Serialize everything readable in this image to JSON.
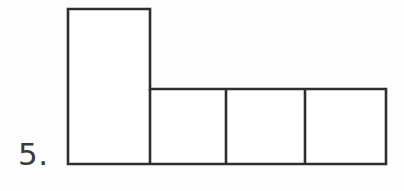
{
  "figure": {
    "problem_number": "5.",
    "caption": "",
    "background_color": "#fdfdfd",
    "stroke_color": "#2e2e2e",
    "fill_color": "#ffffff",
    "stroke_width": 2.6,
    "label_color": "#3a3a3a"
  },
  "chart_data": {
    "type": "diagram",
    "title": "",
    "subtitle": "",
    "xlabel": "",
    "ylabel": "",
    "canvas": {
      "width": 404,
      "height": 191
    },
    "units": "pixels",
    "cells": [
      {
        "name": "tall-rectangle",
        "x": 68,
        "y": 9,
        "width": 82,
        "height": 155
      },
      {
        "name": "square-1",
        "x": 150,
        "y": 89,
        "width": 76,
        "height": 75
      },
      {
        "name": "square-2",
        "x": 226,
        "y": 89,
        "width": 79,
        "height": 75
      },
      {
        "name": "square-3",
        "x": 305,
        "y": 89,
        "width": 81,
        "height": 75
      }
    ],
    "outline_path_points": [
      [
        68,
        9
      ],
      [
        150,
        9
      ],
      [
        150,
        89
      ],
      [
        386,
        89
      ],
      [
        386,
        164
      ],
      [
        68,
        164
      ],
      [
        68,
        9
      ]
    ],
    "interior_dividers": [
      {
        "name": "divider-left",
        "x1": 150,
        "y1": 89,
        "x2": 150,
        "y2": 164
      },
      {
        "name": "divider-middle",
        "x1": 226,
        "y1": 89,
        "x2": 226,
        "y2": 164
      },
      {
        "name": "divider-right",
        "x1": 305,
        "y1": 89,
        "x2": 305,
        "y2": 164
      }
    ],
    "counts": {
      "total_cells": 4,
      "squares_in_row": 3,
      "tall_rectangles": 1
    },
    "grid": false,
    "legend": false
  }
}
